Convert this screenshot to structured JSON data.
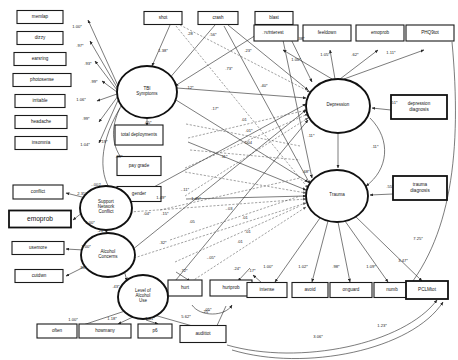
{
  "diagram": {
    "type": "sem-path-diagram",
    "observed_variables": [
      {
        "id": "memlap",
        "label": "memlap",
        "x": 40,
        "y": 17,
        "w": 46,
        "h": 13,
        "bold": false
      },
      {
        "id": "dizzy",
        "label": "dizzy",
        "x": 40,
        "y": 38,
        "w": 46,
        "h": 13,
        "bold": false
      },
      {
        "id": "earsring",
        "label": "earsring",
        "x": 40,
        "y": 59,
        "w": 52,
        "h": 13,
        "bold": false
      },
      {
        "id": "photosense",
        "label": "photosense",
        "x": 42,
        "y": 80,
        "w": 58,
        "h": 13,
        "bold": false
      },
      {
        "id": "irritable",
        "label": "irritable",
        "x": 40,
        "y": 101,
        "w": 50,
        "h": 13,
        "bold": false
      },
      {
        "id": "headache",
        "label": "headache",
        "x": 41,
        "y": 122,
        "w": 52,
        "h": 13,
        "bold": false
      },
      {
        "id": "insomnia",
        "label": "insomnia",
        "x": 41,
        "y": 143,
        "w": 52,
        "h": 13,
        "bold": false
      },
      {
        "id": "conflict",
        "label": "conflict",
        "x": 38,
        "y": 192,
        "w": 50,
        "h": 14,
        "bold": false
      },
      {
        "id": "emoprob_left",
        "label": "emoprob",
        "x": 40,
        "y": 219,
        "w": 62,
        "h": 17,
        "bold": true
      },
      {
        "id": "usemore",
        "label": "usemore",
        "x": 38,
        "y": 248,
        "w": 52,
        "h": 13,
        "bold": false
      },
      {
        "id": "cutdwn",
        "label": "cutdwn",
        "x": 39,
        "y": 276,
        "w": 48,
        "h": 13,
        "bold": false
      },
      {
        "id": "often",
        "label": "often",
        "x": 57,
        "y": 331,
        "w": 40,
        "h": 14,
        "bold": false
      },
      {
        "id": "howmany",
        "label": "howmany",
        "x": 105,
        "y": 331,
        "w": 52,
        "h": 14,
        "bold": false
      },
      {
        "id": "p6",
        "label": "p6",
        "x": 155,
        "y": 331,
        "w": 34,
        "h": 14,
        "bold": false
      },
      {
        "id": "audittot",
        "label": "audittot",
        "x": 203,
        "y": 334,
        "w": 46,
        "h": 17,
        "bold": false
      },
      {
        "id": "shot",
        "label": "shot",
        "x": 163,
        "y": 18,
        "w": 38,
        "h": 13,
        "bold": false
      },
      {
        "id": "crash",
        "label": "crash",
        "x": 218,
        "y": 18,
        "w": 40,
        "h": 13,
        "bold": false
      },
      {
        "id": "blast",
        "label": "blast",
        "x": 274,
        "y": 18,
        "w": 38,
        "h": 13,
        "bold": false
      },
      {
        "id": "interest",
        "label": "interest",
        "x": 276,
        "y": 33,
        "w": 44,
        "h": 16,
        "bold": false
      },
      {
        "id": "feeldown",
        "label": "feeldown",
        "x": 327,
        "y": 33,
        "w": 48,
        "h": 16,
        "bold": false
      },
      {
        "id": "emoprob_right",
        "label": "emoprob",
        "x": 380,
        "y": 33,
        "w": 48,
        "h": 16,
        "bold": false
      },
      {
        "id": "phq9tot",
        "label": "PHQ9tot",
        "x": 430,
        "y": 33,
        "w": 48,
        "h": 16,
        "bold": false
      },
      {
        "id": "total_deployments",
        "label": "total deployments",
        "x": 139,
        "y": 135,
        "w": 48,
        "h": 20,
        "bold": false
      },
      {
        "id": "pay_grade",
        "label": "pay grade",
        "x": 139,
        "y": 166,
        "w": 44,
        "h": 19,
        "bold": false
      },
      {
        "id": "gender",
        "label": "gender",
        "x": 139,
        "y": 194,
        "w": 44,
        "h": 15,
        "bold": false
      },
      {
        "id": "hurt",
        "label": "hurt",
        "x": 185,
        "y": 288,
        "w": 34,
        "h": 16,
        "bold": false
      },
      {
        "id": "hurtprob",
        "label": "hurtprob",
        "x": 231,
        "y": 288,
        "w": 42,
        "h": 16,
        "bold": false
      },
      {
        "id": "intense",
        "label": "intense",
        "x": 267,
        "y": 290,
        "w": 40,
        "h": 15,
        "bold": false
      },
      {
        "id": "avoid",
        "label": "avoid",
        "x": 310,
        "y": 290,
        "w": 36,
        "h": 15,
        "bold": false
      },
      {
        "id": "onguard",
        "label": "onguard",
        "x": 351,
        "y": 290,
        "w": 42,
        "h": 15,
        "bold": false
      },
      {
        "id": "numb",
        "label": "numb",
        "x": 392,
        "y": 290,
        "w": 36,
        "h": 15,
        "bold": false
      },
      {
        "id": "pclmtot",
        "label": "PCLMtot",
        "x": 427,
        "y": 290,
        "w": 42,
        "h": 18,
        "bold": true
      },
      {
        "id": "depression_diagnosis",
        "label": "depression\ndiagnosis",
        "x": 419,
        "y": 107,
        "w": 56,
        "h": 24,
        "bold": true
      },
      {
        "id": "trauma_diagnosis",
        "label": "trauma\ndiagnosis",
        "x": 420,
        "y": 188,
        "w": 54,
        "h": 24,
        "bold": true
      }
    ],
    "latent_variables": [
      {
        "id": "tbi_symptoms",
        "label": "TBI\nSymptoms",
        "cx": 147,
        "cy": 92,
        "rx": 30,
        "ry": 26
      },
      {
        "id": "support_conflict",
        "label": "Support\nNetwork\nConflict",
        "cx": 106,
        "cy": 208,
        "rx": 26,
        "ry": 22
      },
      {
        "id": "alcohol_concerns",
        "label": "Alcohol\nConcerns",
        "cx": 108,
        "cy": 255,
        "rx": 27,
        "ry": 22
      },
      {
        "id": "level_alcohol_use",
        "label": "Level of\nAlcohol\nUse",
        "cx": 143,
        "cy": 297,
        "rx": 25,
        "ry": 22
      },
      {
        "id": "depression",
        "label": "Depression",
        "cx": 338,
        "cy": 106,
        "rx": 32,
        "ry": 27
      },
      {
        "id": "trauma",
        "label": "Trauma",
        "cx": 337,
        "cy": 196,
        "rx": 31,
        "ry": 26
      }
    ],
    "coefficients": [
      {
        "id": "c-memlap",
        "value": "1.00*",
        "x": 77,
        "y": 28
      },
      {
        "id": "c-dizzy",
        "value": ".97*",
        "x": 80,
        "y": 47
      },
      {
        "id": "c-earsring",
        "value": ".93*",
        "x": 88,
        "y": 65
      },
      {
        "id": "c-photosense",
        "value": ".99*",
        "x": 94,
        "y": 83
      },
      {
        "id": "c-irritable",
        "value": "1.06*",
        "x": 81,
        "y": 101
      },
      {
        "id": "c-headache",
        "value": ".99*",
        "x": 86,
        "y": 120
      },
      {
        "id": "c-insomnia",
        "value": "1.04*",
        "x": 85,
        "y": 146
      },
      {
        "id": "c-shot",
        "value": ".28",
        "x": 190,
        "y": 35
      },
      {
        "id": "c-crash",
        "value": ".56*",
        "x": 213,
        "y": 36
      },
      {
        "id": "c-blast",
        "value": ".76*",
        "x": 266,
        "y": 34
      },
      {
        "id": "c-blast2",
        "value": ".38*",
        "x": 301,
        "y": 40
      },
      {
        "id": "c-shot-tbi",
        "value": "1.38*",
        "x": 163,
        "y": 52
      },
      {
        "id": "c-crash-tbi",
        "value": ".73*",
        "x": 229,
        "y": 70
      },
      {
        "id": "c-blast-tbi",
        "value": ".23*",
        "x": 248,
        "y": 52
      },
      {
        "id": "c-tbi-dep",
        "value": ".40*",
        "x": 264,
        "y": 87
      },
      {
        "id": "c-tbi-12",
        "value": ".12*",
        "x": 190,
        "y": 89
      },
      {
        "id": "c-17",
        "value": ".17*",
        "x": 215,
        "y": 110
      },
      {
        "id": "c-01a",
        "value": ".01",
        "x": 244,
        "y": 121
      },
      {
        "id": "c-01b",
        "value": ".01*",
        "x": 249,
        "y": 132
      },
      {
        "id": "c-004",
        "value": ".004",
        "x": 248,
        "y": 144
      },
      {
        "id": "c-deploy",
        "value": ".05*",
        "x": 148,
        "y": 124
      },
      {
        "id": "c-paygrade",
        "value": ".89*",
        "x": 119,
        "y": 158
      },
      {
        "id": "c-dep-neg002",
        "value": "-.002",
        "x": 96,
        "y": 186
      },
      {
        "id": "c-19",
        "value": ".19*",
        "x": 104,
        "y": 143
      },
      {
        "id": "c-gender-11",
        "value": "-.11*",
        "x": 185,
        "y": 191
      },
      {
        "id": "c-11b",
        "value": ".11*",
        "x": 224,
        "y": 158
      },
      {
        "id": "c-conflict",
        "value": "2.35*",
        "x": 82,
        "y": 195
      },
      {
        "id": "c-emoprob-l",
        "value": "1.00*",
        "x": 90,
        "y": 224
      },
      {
        "id": "c-usemore",
        "value": "1.00*",
        "x": 86,
        "y": 248
      },
      {
        "id": "c-cutdwn",
        "value": ".91*",
        "x": 83,
        "y": 269
      },
      {
        "id": "c-snc-ac",
        "value": ".21*",
        "x": 101,
        "y": 232
      },
      {
        "id": "c-ac-lau",
        "value": ".43*",
        "x": 116,
        "y": 288
      },
      {
        "id": "c-often",
        "value": "1.00*",
        "x": 73,
        "y": 321
      },
      {
        "id": "c-howmany",
        "value": "1.18*",
        "x": 112,
        "y": 320
      },
      {
        "id": "c-p6",
        "value": "1.41*",
        "x": 150,
        "y": 320
      },
      {
        "id": "c-audittot",
        "value": "5.62*",
        "x": 186,
        "y": 318
      },
      {
        "id": "c-149",
        "value": "1.49*",
        "x": 161,
        "y": 199
      },
      {
        "id": "c-145",
        "value": "1.45*",
        "x": 196,
        "y": 200
      },
      {
        "id": "c-04",
        "value": ".04*",
        "x": 147,
        "y": 215
      },
      {
        "id": "c-15",
        "value": ".15*",
        "x": 165,
        "y": 215
      },
      {
        "id": "c-05",
        "value": ".05",
        "x": 192,
        "y": 223
      },
      {
        "id": "c-03a",
        "value": "-.03",
        "x": 229,
        "y": 210
      },
      {
        "id": "c-32",
        "value": ".32*",
        "x": 163,
        "y": 244
      },
      {
        "id": "c-05b",
        "value": "-.05*",
        "x": 211,
        "y": 259
      },
      {
        "id": "c-24",
        "value": ".24*",
        "x": 237,
        "y": 270
      },
      {
        "id": "c-72",
        "value": ".72*",
        "x": 184,
        "y": 272
      },
      {
        "id": "c-25",
        "value": ".25*",
        "x": 206,
        "y": 313
      },
      {
        "id": "c-01c",
        "value": ".01",
        "x": 245,
        "y": 219
      },
      {
        "id": "c-01d",
        "value": ".01",
        "x": 248,
        "y": 233
      },
      {
        "id": "c-01e",
        "value": ".01",
        "x": 240,
        "y": 243
      },
      {
        "id": "c-interest",
        "value": "1.00*",
        "x": 296,
        "y": 61
      },
      {
        "id": "c-feeldown",
        "value": "1.05*",
        "x": 325,
        "y": 56
      },
      {
        "id": "c-emoprob-r",
        "value": ".62*",
        "x": 355,
        "y": 56
      },
      {
        "id": "c-phq9tot",
        "value": "1.11*",
        "x": 391,
        "y": 54
      },
      {
        "id": "c-dep-diag",
        "value": ".51*",
        "x": 394,
        "y": 104
      },
      {
        "id": "c-dep-trauma",
        "value": ".11*",
        "x": 375,
        "y": 148
      },
      {
        "id": "c-dep-11",
        "value": ".11*",
        "x": 311,
        "y": 137
      },
      {
        "id": "c-trauma-68",
        "value": ".68*",
        "x": 306,
        "y": 173
      },
      {
        "id": "c-trauma-diag",
        "value": ".55*",
        "x": 390,
        "y": 188
      },
      {
        "id": "c-intense",
        "value": "1.00*",
        "x": 268,
        "y": 268
      },
      {
        "id": "c-avoid",
        "value": "1.02*",
        "x": 303,
        "y": 268
      },
      {
        "id": "c-onguard",
        "value": ".98*",
        "x": 336,
        "y": 268
      },
      {
        "id": "c-numb",
        "value": "1.09*",
        "x": 371,
        "y": 268
      },
      {
        "id": "c-pclmtot",
        "value": "3.47*",
        "x": 403,
        "y": 262
      },
      {
        "id": "c-17b",
        "value": ".17*",
        "x": 252,
        "y": 272
      },
      {
        "id": "c-725",
        "value": "7.25*",
        "x": 418,
        "y": 240
      },
      {
        "id": "c-123",
        "value": "1.23*",
        "x": 382,
        "y": 327
      },
      {
        "id": "c-306",
        "value": "3.06*",
        "x": 318,
        "y": 338
      },
      {
        "id": "c-hurt-prob",
        "value": ".05*",
        "x": 208,
        "y": 311
      }
    ],
    "notes": {
      "significance_marker": "*",
      "line_styles": {
        "solid": "significant path",
        "dashed": "non-significant path"
      }
    }
  }
}
